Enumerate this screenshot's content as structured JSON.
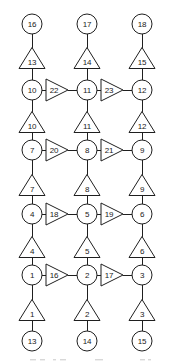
{
  "figure": {
    "type": "node-link-diagram",
    "width": 172,
    "height": 364,
    "background_color": "#ffffff",
    "stroke_color": "#1f1f1f",
    "node_fill": "#ffffff"
  },
  "columns": [
    {
      "id": "col-left",
      "x": 32
    },
    {
      "id": "col-middle",
      "x": 87
    },
    {
      "id": "col-right",
      "x": 142
    }
  ],
  "rows": [
    {
      "id": "row-0",
      "y": 24,
      "shape": "circle"
    },
    {
      "id": "row-1",
      "y": 58,
      "shape": "triangle-up"
    },
    {
      "id": "row-2",
      "y": 90,
      "shape": "circle"
    },
    {
      "id": "row-3",
      "y": 122,
      "shape": "triangle-up"
    },
    {
      "id": "row-4",
      "y": 150,
      "shape": "circle"
    },
    {
      "id": "row-5",
      "y": 185,
      "shape": "triangle-up"
    },
    {
      "id": "row-6",
      "y": 214,
      "shape": "circle"
    },
    {
      "id": "row-7",
      "y": 247,
      "shape": "triangle-up"
    },
    {
      "id": "row-8",
      "y": 275,
      "shape": "circle"
    },
    {
      "id": "row-9",
      "y": 310,
      "shape": "triangle-up"
    },
    {
      "id": "row-10",
      "y": 341,
      "shape": "circle"
    }
  ],
  "circle_nodes": [
    {
      "id": "circle-16",
      "label": "16",
      "col": 0,
      "row": 0
    },
    {
      "id": "circle-17",
      "label": "17",
      "col": 1,
      "row": 0
    },
    {
      "id": "circle-18",
      "label": "18",
      "col": 2,
      "row": 0
    },
    {
      "id": "circle-10",
      "label": "10",
      "col": 0,
      "row": 2
    },
    {
      "id": "circle-11",
      "label": "11",
      "col": 1,
      "row": 2
    },
    {
      "id": "circle-12",
      "label": "12",
      "col": 2,
      "row": 2
    },
    {
      "id": "circle-7",
      "label": "7",
      "col": 0,
      "row": 4
    },
    {
      "id": "circle-8",
      "label": "8",
      "col": 1,
      "row": 4
    },
    {
      "id": "circle-9",
      "label": "9",
      "col": 2,
      "row": 4
    },
    {
      "id": "circle-4",
      "label": "4",
      "col": 0,
      "row": 6
    },
    {
      "id": "circle-5",
      "label": "5",
      "col": 1,
      "row": 6
    },
    {
      "id": "circle-6",
      "label": "6",
      "col": 2,
      "row": 6
    },
    {
      "id": "circle-1",
      "label": "1",
      "col": 0,
      "row": 8
    },
    {
      "id": "circle-2",
      "label": "2",
      "col": 1,
      "row": 8
    },
    {
      "id": "circle-3",
      "label": "3",
      "col": 2,
      "row": 8
    },
    {
      "id": "circle-13",
      "label": "13",
      "col": 0,
      "row": 10
    },
    {
      "id": "circle-14",
      "label": "14",
      "col": 1,
      "row": 10
    },
    {
      "id": "circle-15",
      "label": "15",
      "col": 2,
      "row": 10
    }
  ],
  "triangle_nodes_up": [
    {
      "id": "triangle-13",
      "label": "13",
      "col": 0,
      "row": 1
    },
    {
      "id": "triangle-14",
      "label": "14",
      "col": 1,
      "row": 1
    },
    {
      "id": "triangle-15",
      "label": "15",
      "col": 2,
      "row": 1
    },
    {
      "id": "triangle-10",
      "label": "10",
      "col": 0,
      "row": 3
    },
    {
      "id": "triangle-11",
      "label": "11",
      "col": 1,
      "row": 3
    },
    {
      "id": "triangle-12",
      "label": "12",
      "col": 2,
      "row": 3
    },
    {
      "id": "triangle-7",
      "label": "7",
      "col": 0,
      "row": 5
    },
    {
      "id": "triangle-8",
      "label": "8",
      "col": 1,
      "row": 5
    },
    {
      "id": "triangle-9",
      "label": "9",
      "col": 2,
      "row": 5
    },
    {
      "id": "triangle-4",
      "label": "4",
      "col": 0,
      "row": 7
    },
    {
      "id": "triangle-5",
      "label": "5",
      "col": 1,
      "row": 7
    },
    {
      "id": "triangle-6",
      "label": "6",
      "col": 2,
      "row": 7
    },
    {
      "id": "triangle-1",
      "label": "1",
      "col": 0,
      "row": 9
    },
    {
      "id": "triangle-2",
      "label": "2",
      "col": 1,
      "row": 9
    },
    {
      "id": "triangle-3",
      "label": "3",
      "col": 2,
      "row": 9
    }
  ],
  "triangle_nodes_right": [
    {
      "id": "triangle-22",
      "label": "22",
      "row": 2,
      "from_col": 0,
      "to_col": 1
    },
    {
      "id": "triangle-23",
      "label": "23",
      "row": 2,
      "from_col": 1,
      "to_col": 2
    },
    {
      "id": "triangle-20",
      "label": "20",
      "row": 4,
      "from_col": 0,
      "to_col": 1
    },
    {
      "id": "triangle-21",
      "label": "21",
      "row": 4,
      "from_col": 1,
      "to_col": 2
    },
    {
      "id": "triangle-18",
      "label": "18",
      "row": 6,
      "from_col": 0,
      "to_col": 1
    },
    {
      "id": "triangle-19",
      "label": "19",
      "row": 6,
      "from_col": 1,
      "to_col": 2
    },
    {
      "id": "triangle-16",
      "label": "16",
      "row": 8,
      "from_col": 0,
      "to_col": 1
    },
    {
      "id": "triangle-17",
      "label": "17",
      "row": 8,
      "from_col": 1,
      "to_col": 2
    }
  ]
}
